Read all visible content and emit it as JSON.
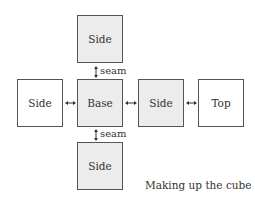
{
  "diagram": {
    "boxes": {
      "side_top": {
        "label": "Side"
      },
      "side_left": {
        "label": "Side"
      },
      "base": {
        "label": "Base"
      },
      "side_right": {
        "label": "Side"
      },
      "top": {
        "label": "Top"
      },
      "side_bottom": {
        "label": "Side"
      }
    },
    "seam_labels": {
      "upper": "seam",
      "lower": "seam"
    },
    "caption": "Making up the cube",
    "colors": {
      "shaded_fill": "#ececec",
      "border": "#555555"
    }
  }
}
